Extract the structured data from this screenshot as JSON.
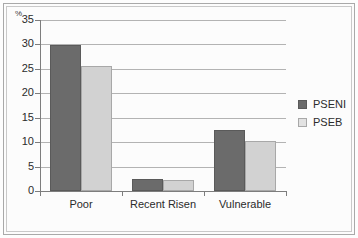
{
  "chart_data": {
    "type": "bar",
    "title": "",
    "subtitle": "",
    "xlabel": "",
    "ylabel": "%",
    "unit_label": "%",
    "categories": [
      "Poor",
      "Recent Risen",
      "Vulnerable"
    ],
    "series": [
      {
        "name": "PSENI",
        "color": "#6b6b6b",
        "values": [
          29.8,
          2.5,
          12.5
        ]
      },
      {
        "name": "PSEB",
        "color": "#d2d2d2",
        "values": [
          25.6,
          2.2,
          10.3
        ]
      }
    ],
    "ylim": [
      0,
      35
    ],
    "ytick_labels": [
      "0",
      "5",
      "10",
      "15",
      "20",
      "25",
      "30",
      "35"
    ],
    "ytick_values": [
      0,
      5,
      10,
      15,
      20,
      25,
      30,
      35
    ],
    "grid": true,
    "grid_axis": "y",
    "legend_position": "right",
    "legend": [
      "PSENI",
      "PSEB"
    ]
  }
}
